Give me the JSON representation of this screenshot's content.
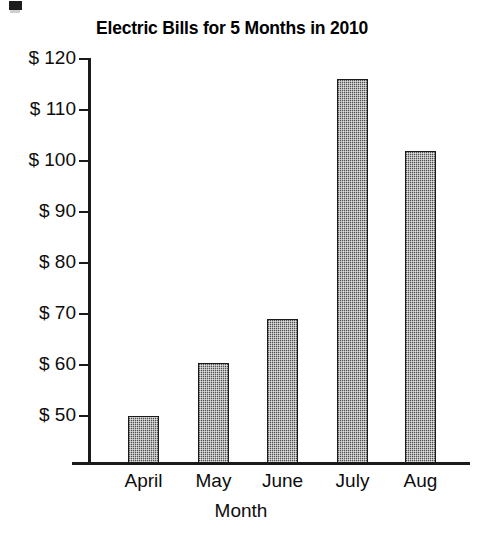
{
  "chart_data": {
    "type": "bar",
    "title": "Electric Bills for 5 Months in 2010",
    "xlabel": "Month",
    "ylabel": "",
    "categories": [
      "April",
      "May",
      "June",
      "July",
      "Aug"
    ],
    "values": [
      50,
      60.5,
      69,
      116,
      102
    ],
    "ylim": [
      40.8,
      122
    ],
    "yticks": [
      50,
      60,
      70,
      80,
      90,
      100,
      110,
      120
    ],
    "ytick_labels": [
      "$ 50",
      "$ 60",
      "$ 70",
      "$ 80",
      "$ 90",
      "$ 100",
      "$ 110",
      "$ 120"
    ],
    "grid": false,
    "legend": "none",
    "bar_fill": "#8f8f8f",
    "bar_edge": "#1a1a1a",
    "axis_color": "#1a1a1a"
  },
  "figure": {
    "background": "#ffffff",
    "artifact_label": "scan-artifact"
  }
}
